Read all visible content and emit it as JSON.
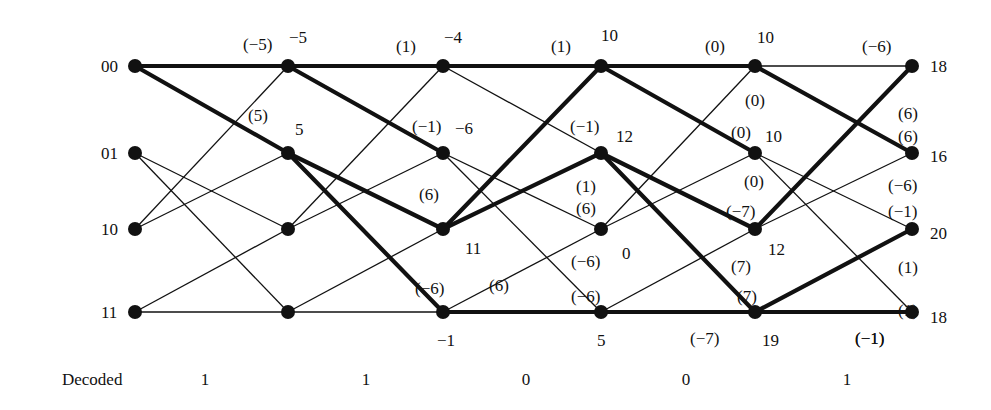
{
  "figure": {
    "type": "viterbi-trellis",
    "decoded_title": "Decoded",
    "states": [
      "00",
      "01",
      "10",
      "11"
    ],
    "columns": 6,
    "node_x": [
      135,
      288,
      443,
      601,
      755,
      912
    ],
    "row_y": [
      66,
      153,
      229,
      312
    ],
    "decoded_bits": [
      "1",
      "1",
      "0",
      "0",
      "1"
    ],
    "decoded_bit_x": [
      205,
      366,
      526,
      686,
      847
    ],
    "decoded_y": 371
  },
  "state_labels": [
    {
      "text": "00",
      "x": 101,
      "y": 58
    },
    {
      "text": "01",
      "x": 101,
      "y": 145
    },
    {
      "text": "10",
      "x": 101,
      "y": 221
    },
    {
      "text": "11",
      "x": 101,
      "y": 304
    }
  ],
  "path_metrics": [
    {
      "text": "−5",
      "x": 289,
      "y": 29
    },
    {
      "text": "5",
      "x": 295,
      "y": 121
    },
    {
      "text": "−4",
      "x": 444,
      "y": 29
    },
    {
      "text": "−6",
      "x": 455,
      "y": 120
    },
    {
      "text": "11",
      "x": 465,
      "y": 240
    },
    {
      "text": "−1",
      "x": 437,
      "y": 332
    },
    {
      "text": "10",
      "x": 601,
      "y": 27
    },
    {
      "text": "12",
      "x": 616,
      "y": 128
    },
    {
      "text": "0",
      "x": 622,
      "y": 245
    },
    {
      "text": "5",
      "x": 597,
      "y": 332
    },
    {
      "text": "10",
      "x": 757,
      "y": 29
    },
    {
      "text": "10",
      "x": 765,
      "y": 128
    },
    {
      "text": "12",
      "x": 768,
      "y": 241
    },
    {
      "text": "19",
      "x": 762,
      "y": 332
    },
    {
      "text": "18",
      "x": 930,
      "y": 58
    },
    {
      "text": "16",
      "x": 930,
      "y": 148
    },
    {
      "text": "20",
      "x": 930,
      "y": 225
    },
    {
      "text": "18",
      "x": 930,
      "y": 309
    }
  ],
  "branch_metrics": [
    {
      "text": "(−5)",
      "x": 243,
      "y": 36
    },
    {
      "text": "(5)",
      "x": 248,
      "y": 107
    },
    {
      "text": "(1)",
      "x": 396,
      "y": 38
    },
    {
      "text": "(−1)",
      "x": 412,
      "y": 118
    },
    {
      "text": "(6)",
      "x": 419,
      "y": 186
    },
    {
      "text": "(−6)",
      "x": 415,
      "y": 280
    },
    {
      "text": "(1)",
      "x": 551,
      "y": 38
    },
    {
      "text": "(−1)",
      "x": 570,
      "y": 118
    },
    {
      "text": "(1)",
      "x": 576,
      "y": 178
    },
    {
      "text": "(6)",
      "x": 576,
      "y": 200
    },
    {
      "text": "(−6)",
      "x": 571,
      "y": 253
    },
    {
      "text": "(−6)",
      "x": 571,
      "y": 288
    },
    {
      "text": "(6)",
      "x": 489,
      "y": 277
    },
    {
      "text": "(0)",
      "x": 705,
      "y": 38
    },
    {
      "text": "(0)",
      "x": 745,
      "y": 92
    },
    {
      "text": "(0)",
      "x": 731,
      "y": 124
    },
    {
      "text": "(0)",
      "x": 744,
      "y": 173
    },
    {
      "text": "(−7)",
      "x": 726,
      "y": 203
    },
    {
      "text": "(7)",
      "x": 731,
      "y": 258
    },
    {
      "text": "(7)",
      "x": 737,
      "y": 288
    },
    {
      "text": "(−7)",
      "x": 690,
      "y": 330
    },
    {
      "text": "(−6)",
      "x": 862,
      "y": 38
    },
    {
      "text": "(6)",
      "x": 898,
      "y": 105
    },
    {
      "text": "(6)",
      "x": 898,
      "y": 128
    },
    {
      "text": "(−6)",
      "x": 888,
      "y": 177
    },
    {
      "text": "(−1)",
      "x": 888,
      "y": 203
    },
    {
      "text": "(1)",
      "x": 898,
      "y": 259
    },
    {
      "text": "(1)",
      "x": 898,
      "y": 302
    },
    {
      "text": "(−1)",
      "x": 855,
      "y": 330
    },
    {
      "text": "(−1)",
      "x": 855,
      "y": 330
    }
  ],
  "edges": [
    {
      "from": [
        0,
        0
      ],
      "to": [
        1,
        0
      ],
      "thick": true
    },
    {
      "from": [
        0,
        0
      ],
      "to": [
        1,
        1
      ],
      "thick": true
    },
    {
      "from": [
        0,
        1
      ],
      "to": [
        1,
        2
      ],
      "thick": false
    },
    {
      "from": [
        0,
        1
      ],
      "to": [
        1,
        3
      ],
      "thick": false
    },
    {
      "from": [
        0,
        2
      ],
      "to": [
        1,
        0
      ],
      "thick": false
    },
    {
      "from": [
        0,
        2
      ],
      "to": [
        1,
        1
      ],
      "thick": false
    },
    {
      "from": [
        0,
        3
      ],
      "to": [
        1,
        2
      ],
      "thick": false
    },
    {
      "from": [
        0,
        3
      ],
      "to": [
        1,
        3
      ],
      "thick": false
    },
    {
      "from": [
        1,
        0
      ],
      "to": [
        2,
        0
      ],
      "thick": true
    },
    {
      "from": [
        1,
        0
      ],
      "to": [
        2,
        1
      ],
      "thick": true
    },
    {
      "from": [
        1,
        1
      ],
      "to": [
        2,
        2
      ],
      "thick": true
    },
    {
      "from": [
        1,
        1
      ],
      "to": [
        2,
        3
      ],
      "thick": true
    },
    {
      "from": [
        1,
        2
      ],
      "to": [
        2,
        0
      ],
      "thick": false
    },
    {
      "from": [
        1,
        2
      ],
      "to": [
        2,
        1
      ],
      "thick": false
    },
    {
      "from": [
        1,
        3
      ],
      "to": [
        2,
        2
      ],
      "thick": false
    },
    {
      "from": [
        1,
        3
      ],
      "to": [
        2,
        3
      ],
      "thick": false
    },
    {
      "from": [
        2,
        0
      ],
      "to": [
        3,
        0
      ],
      "thick": true
    },
    {
      "from": [
        2,
        0
      ],
      "to": [
        3,
        1
      ],
      "thick": false
    },
    {
      "from": [
        2,
        1
      ],
      "to": [
        3,
        2
      ],
      "thick": false
    },
    {
      "from": [
        2,
        1
      ],
      "to": [
        3,
        3
      ],
      "thick": false
    },
    {
      "from": [
        2,
        2
      ],
      "to": [
        3,
        0
      ],
      "thick": true
    },
    {
      "from": [
        2,
        2
      ],
      "to": [
        3,
        1
      ],
      "thick": true
    },
    {
      "from": [
        2,
        3
      ],
      "to": [
        3,
        2
      ],
      "thick": false
    },
    {
      "from": [
        2,
        3
      ],
      "to": [
        3,
        3
      ],
      "thick": true
    },
    {
      "from": [
        3,
        0
      ],
      "to": [
        4,
        0
      ],
      "thick": true
    },
    {
      "from": [
        3,
        0
      ],
      "to": [
        4,
        1
      ],
      "thick": true
    },
    {
      "from": [
        3,
        1
      ],
      "to": [
        4,
        2
      ],
      "thick": true
    },
    {
      "from": [
        3,
        1
      ],
      "to": [
        4,
        3
      ],
      "thick": true
    },
    {
      "from": [
        3,
        2
      ],
      "to": [
        4,
        0
      ],
      "thick": false
    },
    {
      "from": [
        3,
        2
      ],
      "to": [
        4,
        1
      ],
      "thick": false
    },
    {
      "from": [
        3,
        3
      ],
      "to": [
        4,
        2
      ],
      "thick": false
    },
    {
      "from": [
        3,
        3
      ],
      "to": [
        4,
        3
      ],
      "thick": true
    },
    {
      "from": [
        4,
        0
      ],
      "to": [
        5,
        0
      ],
      "thick": false
    },
    {
      "from": [
        4,
        0
      ],
      "to": [
        5,
        1
      ],
      "thick": true
    },
    {
      "from": [
        4,
        1
      ],
      "to": [
        5,
        2
      ],
      "thick": false
    },
    {
      "from": [
        4,
        1
      ],
      "to": [
        5,
        3
      ],
      "thick": false
    },
    {
      "from": [
        4,
        2
      ],
      "to": [
        5,
        0
      ],
      "thick": true
    },
    {
      "from": [
        4,
        2
      ],
      "to": [
        5,
        1
      ],
      "thick": false
    },
    {
      "from": [
        4,
        3
      ],
      "to": [
        5,
        2
      ],
      "thick": true
    },
    {
      "from": [
        4,
        3
      ],
      "to": [
        5,
        3
      ],
      "thick": true
    }
  ]
}
